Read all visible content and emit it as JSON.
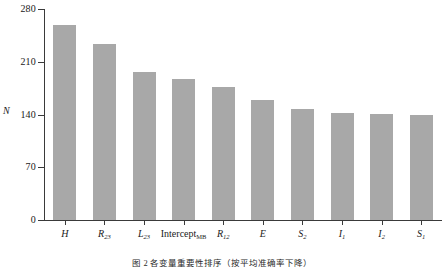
{
  "figure": {
    "caption": "图 2  各变量重要性排序（按平均准确率下降）"
  },
  "chart_data": {
    "type": "bar",
    "title": "",
    "xlabel": "",
    "ylabel": "N",
    "ylim": [
      0,
      280
    ],
    "yticks": [
      0,
      70,
      140,
      210,
      280
    ],
    "ytick_labels": [
      "0",
      "70",
      "140",
      "210",
      "280"
    ],
    "grid": false,
    "legend": null,
    "bar_color": "#a8a8a8",
    "axis_color": "#3a3a3a",
    "categories": [
      "H",
      "R23",
      "L23",
      "InterceptMB",
      "R12",
      "E",
      "S2",
      "I1",
      "I2",
      "S1"
    ],
    "category_labels": [
      {
        "base": "H",
        "sub": "",
        "italic": true
      },
      {
        "base": "R",
        "sub": "23",
        "italic": true
      },
      {
        "base": "L",
        "sub": "23",
        "italic": true
      },
      {
        "base": "Intercept",
        "sub": "MB",
        "italic": false
      },
      {
        "base": "R",
        "sub": "12",
        "italic": true
      },
      {
        "base": "E",
        "sub": "",
        "italic": true
      },
      {
        "base": "S",
        "sub": "2",
        "italic": true
      },
      {
        "base": "I",
        "sub": "1",
        "italic": true
      },
      {
        "base": "I",
        "sub": "2",
        "italic": true
      },
      {
        "base": "S",
        "sub": "1",
        "italic": true
      }
    ],
    "values": [
      259,
      234,
      196,
      187,
      177,
      159,
      147,
      142,
      141,
      140
    ]
  }
}
